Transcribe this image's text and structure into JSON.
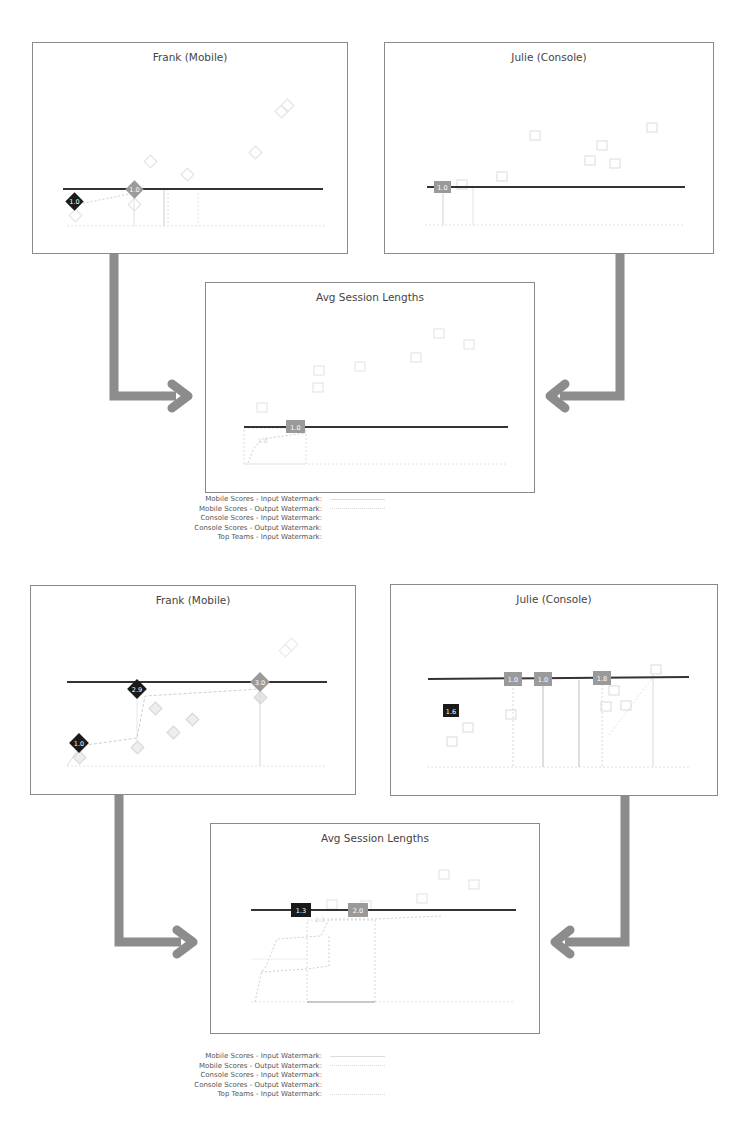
{
  "colors": {
    "panel_border": "#8a8a8a",
    "watermark_line": "#333333",
    "arrow": "#8c8c8c",
    "marker_dark": "#1a1a1a",
    "marker_mid": "#9a9a9a",
    "marker_faint": "#d9d9d9"
  },
  "scenarios": [
    {
      "frank": {
        "title": "Frank (Mobile)",
        "markers": [
          {
            "label": "1.0",
            "shape": "diamond",
            "tone": "dark"
          },
          {
            "label": "1.0",
            "shape": "diamond",
            "tone": "mid"
          }
        ]
      },
      "julie": {
        "title": "Julie (Console)",
        "markers": [
          {
            "label": "1.0",
            "shape": "square",
            "tone": "mid"
          }
        ]
      },
      "avg": {
        "title": "Avg Session Lengths",
        "markers": [
          {
            "label": "1.0",
            "shape": "square",
            "tone": "mid"
          }
        ],
        "faint_label": "1.0"
      },
      "legend": [
        {
          "label": "Mobile Scores - Input Watermark:",
          "style": "solid"
        },
        {
          "label": "Mobile Scores - Output Watermark:",
          "style": "dotted"
        },
        {
          "label": "Console Scores - Input Watermark:",
          "style": "none"
        },
        {
          "label": "Console Scores - Output Watermark:",
          "style": "none"
        },
        {
          "label": "Top Teams - Input Watermark:",
          "style": "none"
        }
      ]
    },
    {
      "frank": {
        "title": "Frank (Mobile)",
        "markers": [
          {
            "label": "1.0",
            "shape": "diamond",
            "tone": "dark"
          },
          {
            "label": "2.9",
            "shape": "diamond",
            "tone": "dark"
          },
          {
            "label": "3.0",
            "shape": "diamond",
            "tone": "mid"
          }
        ]
      },
      "julie": {
        "title": "Julie (Console)",
        "markers": [
          {
            "label": "1.6",
            "shape": "square",
            "tone": "dark"
          },
          {
            "label": "1.0",
            "shape": "square",
            "tone": "mid"
          },
          {
            "label": "1.0",
            "shape": "square",
            "tone": "mid"
          },
          {
            "label": "1.8",
            "shape": "square",
            "tone": "mid"
          }
        ]
      },
      "avg": {
        "title": "Avg Session Lengths",
        "markers": [
          {
            "label": "1.3",
            "shape": "square",
            "tone": "dark"
          },
          {
            "label": "2.0",
            "shape": "square",
            "tone": "mid"
          }
        ],
        "faint_label": "2.3"
      },
      "legend": [
        {
          "label": "Mobile Scores - Input Watermark:",
          "style": "solid"
        },
        {
          "label": "Mobile Scores - Output Watermark:",
          "style": "dotted"
        },
        {
          "label": "Console Scores - Input Watermark:",
          "style": "none"
        },
        {
          "label": "Console Scores - Output Watermark:",
          "style": "none"
        },
        {
          "label": "Top Teams - Input Watermark:",
          "style": "dotted"
        }
      ]
    }
  ]
}
